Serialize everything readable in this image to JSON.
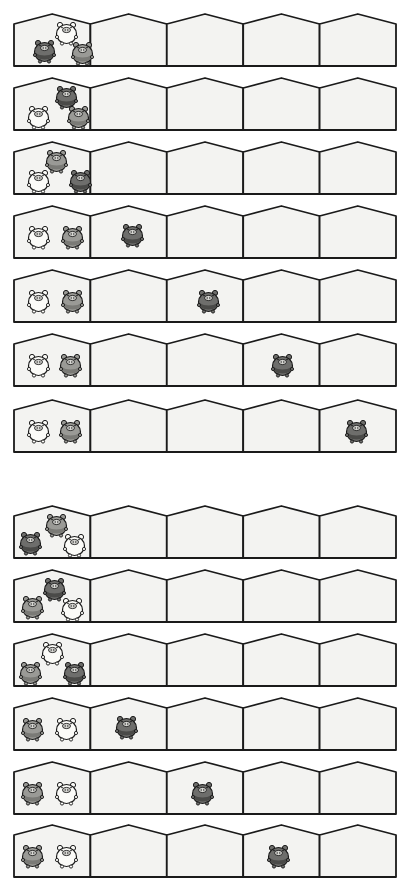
{
  "colors": {
    "house_fill": "#f3f3f1",
    "house_stroke": "#1a1a1a",
    "pig_white": "#fbfbf8",
    "pig_dark": "#6e6e6c",
    "pig_medium": "#9a9a96"
  },
  "houses_per_row": 5,
  "sets": [
    {
      "name": "set-1",
      "rows": [
        {
          "top": 12,
          "pigs": [
            {
              "house": 0,
              "color": "white",
              "x": 36,
              "y": 2
            },
            {
              "house": 0,
              "color": "dark",
              "x": 14,
              "y": 20
            },
            {
              "house": 0,
              "color": "medium",
              "x": 52,
              "y": 22
            }
          ]
        },
        {
          "top": 76,
          "pigs": [
            {
              "house": 0,
              "color": "dark",
              "x": 36,
              "y": 2
            },
            {
              "house": 0,
              "color": "white",
              "x": 8,
              "y": 22
            },
            {
              "house": 0,
              "color": "medium",
              "x": 48,
              "y": 22
            }
          ]
        },
        {
          "top": 140,
          "pigs": [
            {
              "house": 0,
              "color": "medium",
              "x": 26,
              "y": 2
            },
            {
              "house": 0,
              "color": "white",
              "x": 8,
              "y": 22
            },
            {
              "house": 0,
              "color": "dark",
              "x": 50,
              "y": 22
            }
          ]
        },
        {
          "top": 204,
          "pigs": [
            {
              "house": 0,
              "color": "white",
              "x": 8,
              "y": 14
            },
            {
              "house": 0,
              "color": "medium",
              "x": 42,
              "y": 14
            },
            {
              "house": 1,
              "color": "dark",
              "x": 102,
              "y": 12
            }
          ]
        },
        {
          "top": 268,
          "pigs": [
            {
              "house": 0,
              "color": "white",
              "x": 8,
              "y": 14
            },
            {
              "house": 0,
              "color": "medium",
              "x": 42,
              "y": 14
            },
            {
              "house": 2,
              "color": "dark",
              "x": 178,
              "y": 14
            }
          ]
        },
        {
          "top": 332,
          "pigs": [
            {
              "house": 0,
              "color": "white",
              "x": 8,
              "y": 14
            },
            {
              "house": 0,
              "color": "medium",
              "x": 40,
              "y": 14
            },
            {
              "house": 3,
              "color": "dark",
              "x": 252,
              "y": 14
            }
          ]
        },
        {
          "top": 398,
          "pigs": [
            {
              "house": 0,
              "color": "white",
              "x": 8,
              "y": 14
            },
            {
              "house": 0,
              "color": "medium",
              "x": 40,
              "y": 14
            },
            {
              "house": 4,
              "color": "dark",
              "x": 326,
              "y": 14
            }
          ]
        }
      ]
    },
    {
      "name": "set-2",
      "rows": [
        {
          "top": 504,
          "pigs": [
            {
              "house": 0,
              "color": "medium",
              "x": 26,
              "y": 2
            },
            {
              "house": 0,
              "color": "dark",
              "x": 0,
              "y": 20
            },
            {
              "house": 0,
              "color": "white",
              "x": 44,
              "y": 22
            }
          ]
        },
        {
          "top": 568,
          "pigs": [
            {
              "house": 0,
              "color": "dark",
              "x": 24,
              "y": 2
            },
            {
              "house": 0,
              "color": "medium",
              "x": 2,
              "y": 20
            },
            {
              "house": 0,
              "color": "white",
              "x": 42,
              "y": 22
            }
          ]
        },
        {
          "top": 632,
          "pigs": [
            {
              "house": 0,
              "color": "white",
              "x": 22,
              "y": 2
            },
            {
              "house": 0,
              "color": "medium",
              "x": 0,
              "y": 22
            },
            {
              "house": 0,
              "color": "dark",
              "x": 44,
              "y": 22
            }
          ]
        },
        {
          "top": 696,
          "pigs": [
            {
              "house": 0,
              "color": "medium",
              "x": 2,
              "y": 14
            },
            {
              "house": 0,
              "color": "white",
              "x": 36,
              "y": 14
            },
            {
              "house": 1,
              "color": "dark",
              "x": 96,
              "y": 12
            }
          ]
        },
        {
          "top": 760,
          "pigs": [
            {
              "house": 0,
              "color": "medium",
              "x": 2,
              "y": 14
            },
            {
              "house": 0,
              "color": "white",
              "x": 36,
              "y": 14
            },
            {
              "house": 2,
              "color": "dark",
              "x": 172,
              "y": 14
            }
          ]
        },
        {
          "top": 823,
          "pigs": [
            {
              "house": 0,
              "color": "medium",
              "x": 2,
              "y": 14
            },
            {
              "house": 0,
              "color": "white",
              "x": 36,
              "y": 14
            },
            {
              "house": 3,
              "color": "dark",
              "x": 248,
              "y": 14
            }
          ]
        }
      ]
    }
  ]
}
